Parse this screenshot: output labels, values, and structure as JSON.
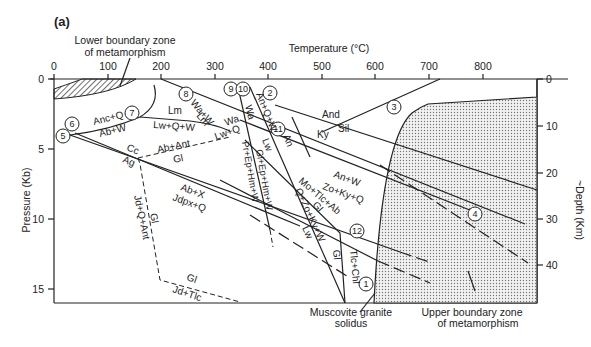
{
  "figure": {
    "panel_label": "(a)",
    "x_axis": {
      "title": "Temperature (°C)",
      "ticks": [
        "0",
        "100",
        "200",
        "300",
        "400",
        "500",
        "600",
        "700",
        "800"
      ]
    },
    "y_axis_left": {
      "title": "Pressure (Kb)",
      "ticks": [
        "0",
        "5",
        "10",
        "15"
      ]
    },
    "y_axis_right": {
      "title": "~Depth (Km)",
      "ticks": [
        "0",
        "10",
        "20",
        "30",
        "40"
      ]
    },
    "annotations": {
      "lower_zone_1": "Lower boundary zone",
      "lower_zone_2": "of metamorphism",
      "upper_zone_1": "Upper boundary zone",
      "upper_zone_2": "of metamorphism",
      "solidus_1": "Muscovite granite",
      "solidus_2": "solidus"
    },
    "reaction_numbers": [
      "1",
      "2",
      "3",
      "4",
      "5",
      "6",
      "7",
      "8",
      "9",
      "10",
      "11",
      "12"
    ],
    "reaction_labels": {
      "and": "And",
      "sil": "Sil",
      "ky": "Ky",
      "anc_q": "Anc+Q",
      "ab_w": "Ab+W",
      "lm": "Lm",
      "lw_q_w": "Lw+Q+W",
      "cc": "Cc",
      "ag": "Ag",
      "ab_ant": "Ab+Ant",
      "gl_1": "Gl",
      "ab_x": "Ab+X",
      "jdpx_q": "Jdpx+Q",
      "gl_2": "Gl",
      "jd_q_ant": "Jd+Q+Ant",
      "gl_3": "Gl",
      "jd_tlc": "Jd+Tlc",
      "wa_w": "Wa+W",
      "lm_2": "Lm",
      "wa": "Wa",
      "lw_q": "Lw+Q",
      "wa_2": "Wa",
      "an_q_w": "An+Q+W",
      "an": "An",
      "lw": "Lw",
      "pr_ep_hm_w": "Pr+Ep+Hm+W",
      "gl_ep_hm_w": "Gl+Ep+Hm+W",
      "an_w": "An+W",
      "zo_ky_q": "Zo+Ky+Q",
      "mo_tlc_ab": "Mo+Tlc+Ab",
      "gl_4": "Gl",
      "q_zo_ky_w": "Q+Zo+Ky+W",
      "lw_2": "Lw",
      "gl_5": "Gl",
      "tlc_chl": "Tlc+Chl"
    }
  }
}
